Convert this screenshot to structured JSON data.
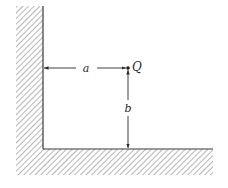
{
  "diagram": {
    "labels": {
      "point": "Q",
      "horizontal_distance": "a",
      "vertical_distance": "b"
    },
    "colors": {
      "line": "#3a3a3a",
      "hatch": "#7a7a7a",
      "background": "#ffffff"
    }
  }
}
